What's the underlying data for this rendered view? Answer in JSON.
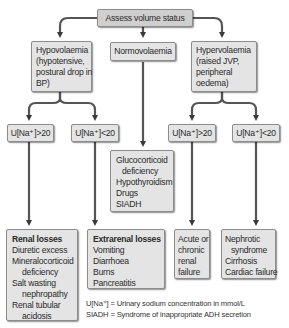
{
  "diagram": {
    "root": "Assess volume status",
    "branches": {
      "hypo": {
        "lines": [
          "Hypovolaemia",
          "(hypotensive,",
          "postural drop in",
          "BP)"
        ],
        "gt20": "U[Na⁺]>20",
        "lt20": "U[Na⁺]<20",
        "gt20_result": {
          "title": "Renal losses",
          "items": [
            "Diuretic excess",
            "Mineralocorticoid",
            "deficiency",
            "Salt wasting",
            "nephropathy",
            "Renal tubular",
            "acidosis"
          ]
        },
        "lt20_result": {
          "title": "Extrarenal losses",
          "items": [
            "Vomiting",
            "Diarrhoea",
            "Burns",
            "Pancreatitis"
          ]
        }
      },
      "normo": {
        "label": "Normovolaemia",
        "result": [
          "Glucocorticoid",
          "deficiency",
          "Hypothyroidism",
          "Drugs",
          "SIADH"
        ]
      },
      "hyper": {
        "lines": [
          "Hypervolaemia",
          "(raised JVP,",
          "peripheral",
          "oedema)"
        ],
        "gt20": "U[Na⁺]>20",
        "lt20": "U[Na⁺]<20",
        "gt20_result": [
          "Acute or",
          "chronic",
          "renal",
          "failure"
        ],
        "lt20_result": [
          "Nephrotic",
          "syndrome",
          "Cirrhosis",
          "Cardiac failure"
        ]
      }
    },
    "legend": [
      "U[Na⁺] = Urinary sodium concentration in mmol/L",
      "SIADH = Syndrome of inappropriate ADH secretion"
    ]
  }
}
